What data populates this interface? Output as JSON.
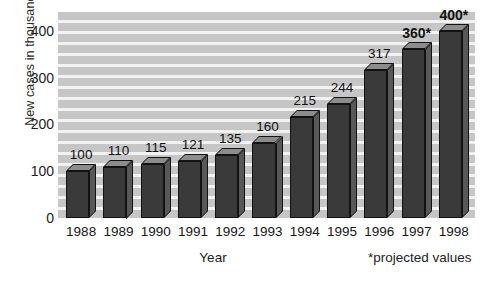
{
  "chart_data": {
    "type": "bar",
    "title": "",
    "xlabel": "Year",
    "ylabel": "New cases in thousands",
    "categories": [
      "1988",
      "1989",
      "1990",
      "1991",
      "1992",
      "1993",
      "1994",
      "1995",
      "1996",
      "1997",
      "1998"
    ],
    "values": [
      100,
      110,
      115,
      121,
      135,
      160,
      215,
      244,
      317,
      360,
      400
    ],
    "point_labels": [
      "100",
      "110",
      "115",
      "121",
      "135",
      "160",
      "215",
      "244",
      "317",
      "360*",
      "400*"
    ],
    "projected": [
      false,
      false,
      false,
      false,
      false,
      false,
      false,
      false,
      false,
      true,
      true
    ],
    "ylim": [
      0,
      440
    ],
    "yticks": [
      0,
      100,
      200,
      300,
      400
    ],
    "ytick_labels": [
      "0",
      "100",
      "200",
      "300",
      "400"
    ],
    "grid": true,
    "legend": "none",
    "annotation": "*projected values",
    "colors": {
      "bar_front": "#3a3a3a",
      "bar_top": "#8c8c8c",
      "bar_side": "#585858",
      "plot_background": "#c3c3c3",
      "gridline": "#f2f2f2",
      "text": "#111111"
    }
  },
  "axes": {
    "y_title": "New cases in thousands",
    "x_title": "Year"
  },
  "footnote": {
    "text": "*projected values"
  }
}
